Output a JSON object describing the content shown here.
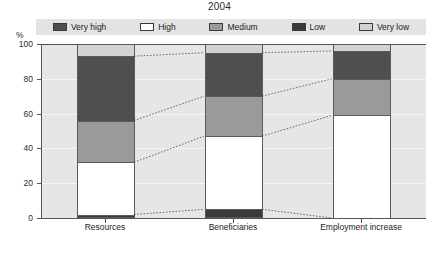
{
  "title": "2004",
  "y_unit": "%",
  "legend": {
    "items": [
      {
        "label": "Very high",
        "color": "#4f4f4f"
      },
      {
        "label": "High",
        "color": "#ffffff"
      },
      {
        "label": "Medium",
        "color": "#9a9a9a"
      },
      {
        "label": "Low",
        "color": "#3a3a3a"
      },
      {
        "label": "Very low",
        "color": "#d2d2d2"
      }
    ]
  },
  "axis": {
    "y_ticks": [
      "0",
      "20",
      "40",
      "60",
      "80",
      "100"
    ],
    "x_labels": [
      "Resources",
      "Beneficiaries",
      "Employment increase"
    ]
  },
  "footnote": "",
  "chart_data": {
    "type": "bar",
    "title": "2004",
    "xlabel": "",
    "ylabel": "%",
    "ylim": [
      0,
      100
    ],
    "stacked": true,
    "normalized_percent": true,
    "grid": true,
    "legend_position": "top",
    "categories": [
      "Resources",
      "Beneficiaries",
      "Employment increase"
    ],
    "series": [
      {
        "name": "Low",
        "color": "#3a3a3a",
        "values": [
          2,
          5,
          0
        ]
      },
      {
        "name": "High",
        "color": "#ffffff",
        "values": [
          30,
          42,
          59
        ]
      },
      {
        "name": "Medium",
        "color": "#9a9a9a",
        "values": [
          24,
          23,
          21
        ]
      },
      {
        "name": "Very high",
        "color": "#4f4f4f",
        "values": [
          37,
          25,
          16
        ]
      },
      {
        "name": "Very low",
        "color": "#d2d2d2",
        "values": [
          7,
          5,
          4
        ]
      }
    ],
    "stack_order_bottom_to_top": [
      "Low",
      "High",
      "Medium",
      "Very high",
      "Very low"
    ],
    "cumulative_boundaries": {
      "Resources": [
        0,
        2,
        32,
        56,
        93,
        100
      ],
      "Beneficiaries": [
        0,
        5,
        47,
        70,
        95,
        100
      ],
      "Employment increase": [
        0,
        0,
        59,
        80,
        96,
        100
      ]
    },
    "connector_lines": "dotted lines join matching segment boundaries between adjacent bars"
  }
}
